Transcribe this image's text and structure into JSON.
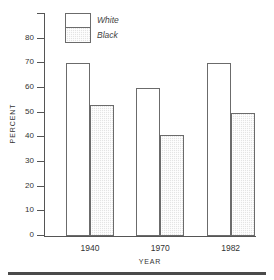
{
  "chart_data": {
    "type": "bar",
    "title": "",
    "xlabel": "YEAR",
    "ylabel": "PERCENT",
    "categories": [
      "1940",
      "1970",
      "1982"
    ],
    "series": [
      {
        "name": "White",
        "values": [
          70,
          60,
          70
        ],
        "fill": "#ffffff"
      },
      {
        "name": "Black",
        "values": [
          53,
          41,
          50
        ],
        "fill": "#e4e4e4"
      }
    ],
    "ylim": [
      0,
      90
    ],
    "ytick_values": [
      0,
      10,
      20,
      30,
      40,
      50,
      60,
      70,
      80,
      90
    ],
    "ytick_labels": [
      "0",
      "10",
      "20",
      "30",
      "40",
      "50",
      "60",
      "70",
      "80",
      ""
    ],
    "grid": false,
    "legend_position": "upper left inside"
  },
  "axes": {
    "y_title": "PERCENT",
    "x_title": "YEAR"
  },
  "legend": {
    "entries": [
      {
        "label": "White",
        "swatch": "white-swatch"
      },
      {
        "label": "Black",
        "swatch": "black-hatched-swatch"
      }
    ]
  }
}
